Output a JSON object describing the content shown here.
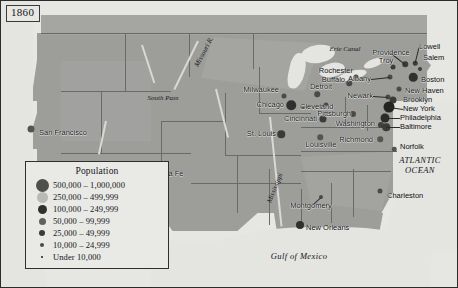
{
  "map": {
    "year_label": "1860",
    "background_color": "#9d9d9a",
    "ocean_color": "#e6e6e3",
    "border_color": "#2b2b2b"
  },
  "legend": {
    "title": "Population",
    "classes": [
      {
        "label": "500,000 – 1,000,000",
        "size": 13,
        "color": "#4f4f4d"
      },
      {
        "label": "250,000 – 499,999",
        "size": 11,
        "color": "#b9b9b6"
      },
      {
        "label": "100,000 – 249,999",
        "size": 9,
        "color": "#30302e"
      },
      {
        "label": "50,000 – 99,999",
        "size": 7,
        "color": "#606060"
      },
      {
        "label": "25,000 – 49,999",
        "size": 6,
        "color": "#3b3b39"
      },
      {
        "label": "10,000 – 24,999",
        "size": 4.5,
        "color": "#4a4a48"
      },
      {
        "label": "Under 10,000",
        "size": 2.5,
        "color": "#1c1c1a"
      }
    ]
  },
  "cities": [
    {
      "name": "San Francisco",
      "x": 30,
      "y": 128,
      "dot": 7,
      "color": "#55554f",
      "anchor": "right",
      "lx": 38,
      "ly": 132
    },
    {
      "name": "Santa Fe",
      "x": 148,
      "y": 172,
      "dot": 2.5,
      "color": "#1c1c1a",
      "anchor": "right",
      "lx": 152,
      "ly": 173
    },
    {
      "name": "Milwaukee",
      "x": 283,
      "y": 95,
      "dot": 5,
      "color": "#4a4a48",
      "anchor": "left",
      "lx": 278,
      "ly": 89
    },
    {
      "name": "Chicago",
      "x": 290,
      "y": 104,
      "dot": 9.5,
      "color": "#303030",
      "anchor": "left",
      "lx": 283,
      "ly": 104
    },
    {
      "name": "Detroit",
      "x": 316,
      "y": 93,
      "dot": 5.5,
      "color": "#4a4a48",
      "anchor": "center",
      "lx": 320,
      "ly": 86
    },
    {
      "name": "Cleveland",
      "x": 325,
      "y": 104,
      "dot": 5,
      "color": "#4a4a48",
      "anchor": "right",
      "lx": 299,
      "ly": 106
    },
    {
      "name": "Cincinnati",
      "x": 322,
      "y": 118,
      "dot": 7,
      "color": "#3b3b39",
      "anchor": "left",
      "lx": 316,
      "ly": 118
    },
    {
      "name": "Pittsburgh",
      "x": 352,
      "y": 113,
      "dot": 6,
      "color": "#4a4a48",
      "anchor": "left",
      "lx": 350,
      "ly": 113
    },
    {
      "name": "St. Louis",
      "x": 280,
      "y": 133,
      "dot": 7.5,
      "color": "#3b3b39",
      "anchor": "left",
      "lx": 275,
      "ly": 133
    },
    {
      "name": "Louisville",
      "x": 319,
      "y": 136,
      "dot": 5.5,
      "color": "#55554f",
      "anchor": "center",
      "lx": 320,
      "ly": 144
    },
    {
      "name": "Washington",
      "x": 380,
      "y": 124,
      "dot": 6,
      "color": "#404040",
      "anchor": "left",
      "lx": 374,
      "ly": 123
    },
    {
      "name": "Richmond",
      "x": 379,
      "y": 138,
      "dot": 5.5,
      "color": "#55554f",
      "anchor": "left",
      "lx": 372,
      "ly": 139
    },
    {
      "name": "Norfolk",
      "x": 393,
      "y": 148,
      "dot": 4.5,
      "color": "#55554f",
      "anchor": "right",
      "lx": 399,
      "ly": 146
    },
    {
      "name": "Rochester",
      "x": 355,
      "y": 76,
      "dot": 5,
      "color": "#4a4a48",
      "anchor": "left",
      "lx": 352,
      "ly": 70
    },
    {
      "name": "Buffalo",
      "x": 348,
      "y": 82,
      "dot": 5.5,
      "color": "#4a4a48",
      "anchor": "left",
      "lx": 344,
      "ly": 79
    },
    {
      "name": "Troy",
      "x": 392,
      "y": 66,
      "dot": 5,
      "color": "#3b3b39",
      "anchor": "center",
      "lx": 385,
      "ly": 60
    },
    {
      "name": "Albany",
      "x": 389,
      "y": 76,
      "dot": 5,
      "color": "#4a4a48",
      "anchor": "left",
      "lx": 370,
      "ly": 78
    },
    {
      "name": "Providence",
      "x": 404,
      "y": 63,
      "dot": 5.5,
      "color": "#3b3b39",
      "anchor": "center",
      "lx": 390,
      "ly": 52
    },
    {
      "name": "Lowell",
      "x": 414,
      "y": 62,
      "dot": 4.5,
      "color": "#3b3b39",
      "anchor": "right",
      "lx": 418,
      "ly": 46
    },
    {
      "name": "Salem",
      "x": 419,
      "y": 68,
      "dot": 4,
      "color": "#3b3b39",
      "anchor": "right",
      "lx": 422,
      "ly": 57
    },
    {
      "name": "Boston",
      "x": 412,
      "y": 76,
      "dot": 8.5,
      "color": "#303030",
      "anchor": "right",
      "lx": 420,
      "ly": 79
    },
    {
      "name": "New Haven",
      "x": 398,
      "y": 88,
      "dot": 5,
      "color": "#4a4a48",
      "anchor": "right",
      "lx": 404,
      "ly": 90
    },
    {
      "name": "Newark",
      "x": 387,
      "y": 96,
      "dot": 5,
      "color": "#4a4a48",
      "anchor": "left",
      "lx": 372,
      "ly": 95
    },
    {
      "name": "Brooklyn",
      "x": 392,
      "y": 99,
      "dot": 7,
      "color": "#3b3b39",
      "anchor": "right",
      "lx": 402,
      "ly": 99
    },
    {
      "name": "New York",
      "x": 388,
      "y": 106,
      "dot": 11,
      "color": "#242422",
      "anchor": "right",
      "lx": 402,
      "ly": 108
    },
    {
      "name": "Philadelphia",
      "x": 384,
      "y": 117,
      "dot": 9,
      "color": "#2b2b29",
      "anchor": "right",
      "lx": 399,
      "ly": 117
    },
    {
      "name": "Baltimore",
      "x": 385,
      "y": 126,
      "dot": 7.5,
      "color": "#3b3b39",
      "anchor": "right",
      "lx": 399,
      "ly": 126
    },
    {
      "name": "Montgomery",
      "x": 320,
      "y": 196,
      "dot": 4,
      "color": "#4a4a48",
      "anchor": "center",
      "lx": 310,
      "ly": 205
    },
    {
      "name": "New Orleans",
      "x": 299,
      "y": 224,
      "dot": 8,
      "color": "#303030",
      "anchor": "right",
      "lx": 305,
      "ly": 227
    },
    {
      "name": "Charleston",
      "x": 379,
      "y": 190,
      "dot": 5,
      "color": "#4a4a48",
      "anchor": "right",
      "lx": 386,
      "ly": 195
    }
  ],
  "geo_labels": [
    {
      "text": "Missouri R.",
      "x": 203,
      "y": 51,
      "style": "rot-neg"
    },
    {
      "text": "South Pass",
      "x": 162,
      "y": 97,
      "style": "plain"
    },
    {
      "text": "Erie Canal",
      "x": 344,
      "y": 48,
      "style": "plain"
    },
    {
      "text": "Mississippi",
      "x": 274,
      "y": 187,
      "style": "rot-mid"
    }
  ],
  "ocean_labels": [
    {
      "line1": "ATLANTIC",
      "line2": "OCEAN",
      "x": 419,
      "y": 164
    },
    {
      "line1": "Gulf of Mexico",
      "line2": "",
      "x": 298,
      "y": 255
    }
  ]
}
